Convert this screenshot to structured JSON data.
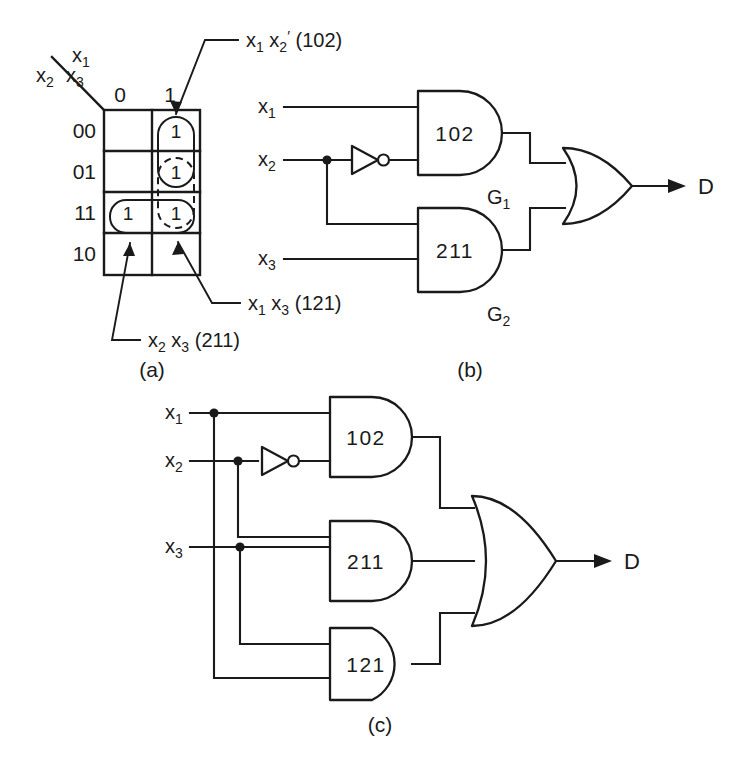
{
  "figure": {
    "background_color": "#ffffff",
    "ink_color": "#1a1a1a",
    "panels": [
      {
        "id": "a",
        "caption": "(a)"
      },
      {
        "id": "b",
        "caption": "(b)"
      },
      {
        "id": "c",
        "caption": "(c)"
      }
    ]
  },
  "kmap": {
    "corner_label_rows": "x2 x3",
    "corner_label_cols": "x1",
    "corner_row_var_1": "x",
    "corner_row_sub_1": "2",
    "corner_row_var_2": "x",
    "corner_row_sub_2": "3",
    "corner_col_var": "x",
    "corner_col_sub": "1",
    "column_headers": [
      "0",
      "1"
    ],
    "row_headers": [
      "00",
      "01",
      "11",
      "10"
    ],
    "cells": [
      {
        "row": "00",
        "col": "0",
        "value": ""
      },
      {
        "row": "00",
        "col": "1",
        "value": "1"
      },
      {
        "row": "01",
        "col": "0",
        "value": ""
      },
      {
        "row": "01",
        "col": "1",
        "value": "1"
      },
      {
        "row": "11",
        "col": "0",
        "value": "1"
      },
      {
        "row": "11",
        "col": "1",
        "value": "1"
      },
      {
        "row": "10",
        "col": "0",
        "value": ""
      },
      {
        "row": "10",
        "col": "1",
        "value": ""
      }
    ],
    "groupings": [
      {
        "name": "x1 x2-prime",
        "style": "solid",
        "code": "102"
      },
      {
        "name": "x2 x3",
        "style": "solid",
        "code": "211"
      },
      {
        "name": "x1 x3",
        "style": "dashed",
        "code": "121"
      }
    ],
    "annotations": [
      {
        "id": "ann-102",
        "var1": "x",
        "sub1": "1",
        "var2": "x",
        "sub2": "2",
        "prime": "′",
        "code": "(102)"
      },
      {
        "id": "ann-121",
        "var1": "x",
        "sub1": "1",
        "var2": "x",
        "sub2": "3",
        "prime": "",
        "code": "(121)"
      },
      {
        "id": "ann-211",
        "var1": "x",
        "sub1": "2",
        "var2": "x",
        "sub2": "3",
        "prime": "",
        "code": "(211)"
      }
    ]
  },
  "circuit_b": {
    "inputs": [
      {
        "var": "x",
        "sub": "1"
      },
      {
        "var": "x",
        "sub": "2"
      },
      {
        "var": "x",
        "sub": "3"
      }
    ],
    "and_gates": [
      {
        "label": "102",
        "tag_var": "G",
        "tag_sub": "1"
      },
      {
        "label": "211",
        "tag_var": "G",
        "tag_sub": "2"
      }
    ],
    "inverter": {
      "name": "not-gate",
      "on_input": "x2"
    },
    "or_gate": {
      "name": "or-gate",
      "inputs": 2
    },
    "output": "D"
  },
  "circuit_c": {
    "inputs": [
      {
        "var": "x",
        "sub": "1"
      },
      {
        "var": "x",
        "sub": "2"
      },
      {
        "var": "x",
        "sub": "3"
      }
    ],
    "and_gates": [
      {
        "label": "102"
      },
      {
        "label": "211"
      },
      {
        "label": "121"
      }
    ],
    "inverter": {
      "name": "not-gate",
      "on_input": "x2"
    },
    "or_gate": {
      "name": "or-gate",
      "inputs": 3
    },
    "output": "D"
  }
}
